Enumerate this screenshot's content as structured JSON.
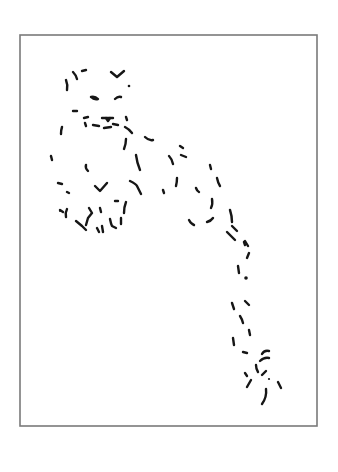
{
  "artwork": {
    "subject": "snow leopard dashed line drawing",
    "background_color": "#ffffff",
    "ink_color": "#161616",
    "frame": {
      "color": "#7a7a7a",
      "x": 20,
      "y": 35,
      "width": 297,
      "height": 391
    },
    "regions": {
      "head": [
        "M66 80 Q68 85 67 90",
        "M73 72 Q76 75 77 79",
        "M82 71 L86 70",
        "M111 72 L117 77 L124 71",
        "M91 97 Q95 96 98 99 Q94 100 91 97",
        "M115 99 Q118 96 121 97",
        "M73 111 L77 111",
        "M62 127 Q61 130 61 134"
      ],
      "muzzle": [
        "M84 118 L88 117",
        "M85 123 L86 126",
        "M93 125 L99 126",
        "M102 118 L113 118",
        "M106 118 L108 121 L110 118",
        "M104 128 L111 127",
        "M113 124 L118 125",
        "M126 117 L127 120",
        "M125 127 Q129 129 132 133"
      ],
      "body": [
        "M145 137 Q149 141 153 140",
        "M126 139 Q126 144 124 149",
        "M51 156 L52 160",
        "M86 165 Q85 168 88 171",
        "M136 155 Q137 163 140 170",
        "M169 156 Q172 159 173 164",
        "M181 155 L186 157",
        "M180 146 L183 148",
        "M58 183 L62 184",
        "M67 192 L69 193",
        "M95 186 L100 191 L107 183",
        "M130 181 Q136 184 137 186 Q139 190 141 194",
        "M163 190 L164 193",
        "M177 178 Q177 182 176 186",
        "M196 188 Q197 191 199 192",
        "M210 165 L211 169",
        "M217 178 Q218 183 220 186"
      ],
      "paws": [
        "M60 210 L63 212",
        "M67 209 Q65 213 66 217",
        "M76 221 L82 226 L86 230",
        "M89 208 L92 213 L88 218 L86 225",
        "M100 208 L101 212",
        "M115 201 L118 201",
        "M126 202 Q124 207 124 213",
        "M97 228 L99 232",
        "M102 226 L103 232",
        "M110 219 Q111 224 112 226 L116 228",
        "M121 218 L121 224"
      ],
      "haunch": [
        "M189 220 Q191 224 194 225",
        "M207 222 Q211 221 213 218",
        "M212 199 Q213 204 211 208",
        "M230 210 Q232 216 232 222",
        "M232 226 L237 231",
        "M227 232 Q231 236 235 240",
        "M244 242 L245 245"
      ],
      "tail": [
        "M245 241 L248 246",
        "M249 253 L247 258",
        "M238 266 L239 273",
        "M232 303 Q233 306 234 309",
        "M245 301 L249 305",
        "M240 316 Q242 319 243 323",
        "M249 330 L250 335",
        "M233 338 L234 345"
      ],
      "tail_tip": [
        "M243 352 L247 353",
        "M262 354 Q264 350 269 351",
        "M260 361 Q264 357 269 358",
        "M245 373 L247 376",
        "M256 365 Q256 369 258 372",
        "M262 375 L266 371",
        "M247 387 L251 380",
        "M266 389 Q267 397 262 404",
        "M278 382 L281 388"
      ],
      "dots": [
        {
          "cx": 129,
          "cy": 86,
          "r": 1.3
        },
        {
          "cx": 246,
          "cy": 278,
          "r": 1.8
        },
        {
          "cx": 60,
          "cy": 211,
          "r": 1.0
        },
        {
          "cx": 269,
          "cy": 379,
          "r": 1.1
        }
      ]
    }
  }
}
